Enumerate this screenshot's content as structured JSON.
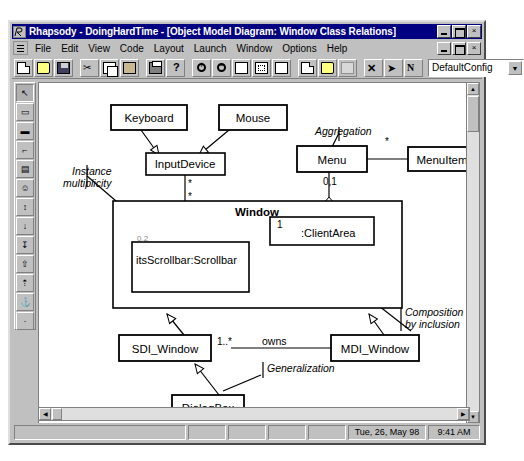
{
  "window": {
    "title": "Rhapsody - DoingHardTime - [Object Model Diagram: Window Class Relations]",
    "app_icon": "rhapsody-icon",
    "minimize_label": "",
    "maximize_label": "",
    "close_label": "×"
  },
  "menubar": {
    "items": [
      {
        "label": "File"
      },
      {
        "label": "Edit"
      },
      {
        "label": "View"
      },
      {
        "label": "Code"
      },
      {
        "label": "Layout"
      },
      {
        "label": "Launch"
      },
      {
        "label": "Window"
      },
      {
        "label": "Options"
      },
      {
        "label": "Help"
      }
    ],
    "mdi_restore_label": "",
    "mdi_minimize_label": "",
    "mdi_close_label": "×"
  },
  "toolbar": {
    "buttons": [
      {
        "name": "new-file-icon",
        "glyph": "g-doc"
      },
      {
        "name": "open-file-icon",
        "glyph": "g-open"
      },
      {
        "name": "save-file-icon",
        "glyph": "g-save"
      },
      {
        "name": "cut-icon",
        "glyph": "g-cut",
        "char": "✂"
      },
      {
        "name": "copy-icon",
        "glyph": "g-copy"
      },
      {
        "name": "paste-icon",
        "glyph": "g-paste"
      },
      {
        "name": "print-icon",
        "glyph": "g-print"
      },
      {
        "name": "help-icon",
        "glyph": "g-help"
      },
      {
        "name": "zoom-in-icon",
        "glyph": "g-zin"
      },
      {
        "name": "zoom-out-icon",
        "glyph": "g-zout"
      },
      {
        "name": "zoom-fit-icon",
        "glyph": "g-rect"
      },
      {
        "name": "zoom-selection-icon",
        "glyph": "g-fit"
      },
      {
        "name": "refresh-icon",
        "glyph": "g-rect"
      },
      {
        "name": "new-diagram-icon",
        "glyph": "g-doc"
      },
      {
        "name": "browse-icon",
        "glyph": "g-open"
      },
      {
        "name": "properties-icon",
        "glyph": "g-blank"
      },
      {
        "name": "delete-icon",
        "glyph": "g-x",
        "char": "✕"
      },
      {
        "name": "run-icon",
        "glyph": "g-arrow",
        "char": "➤"
      },
      {
        "name": "next-icon",
        "glyph": "g-n",
        "char": "N"
      }
    ],
    "config_combo": {
      "value": "DefaultConfig",
      "arrow": "▼"
    }
  },
  "palette": {
    "buttons": [
      {
        "name": "select-tool",
        "char": "↖",
        "selected": true
      },
      {
        "name": "class-tool",
        "char": "▭"
      },
      {
        "name": "object-tool",
        "char": "▬"
      },
      {
        "name": "package-tool",
        "char": "⌐"
      },
      {
        "name": "note-tool",
        "char": "▤"
      },
      {
        "name": "actor-tool",
        "char": "☺"
      },
      {
        "name": "association-tool",
        "char": "↕"
      },
      {
        "name": "aggregation-tool",
        "char": "↓"
      },
      {
        "name": "composition-tool",
        "char": "↧"
      },
      {
        "name": "generalization-tool",
        "char": "⇧"
      },
      {
        "name": "dependency-tool",
        "char": "⇡"
      },
      {
        "name": "anchor-tool",
        "char": "⚓"
      },
      {
        "name": "text-tool",
        "char": "·"
      }
    ]
  },
  "diagram": {
    "title": "Object Model Diagram: Window Class Relations",
    "classes": [
      {
        "id": "keyboard",
        "label": "Keyboard",
        "x": 100,
        "y": 82,
        "w": 76,
        "h": 22
      },
      {
        "id": "mouse",
        "label": "Mouse",
        "x": 208,
        "y": 82,
        "w": 68,
        "h": 22
      },
      {
        "id": "inputdevice",
        "label": "InputDevice",
        "x": 135,
        "y": 129,
        "w": 78,
        "h": 20
      },
      {
        "id": "menu",
        "label": "Menu",
        "x": 286,
        "y": 122,
        "w": 70,
        "h": 24
      },
      {
        "id": "menuitem",
        "label": "MenuItem",
        "x": 397,
        "y": 124,
        "w": 68,
        "h": 22
      },
      {
        "id": "window",
        "label": "Window",
        "x": 102,
        "y": 178,
        "w": 289,
        "h": 107
      },
      {
        "id": "scrollbar",
        "label": "itsScrollbar:Scrollbar",
        "x": 121,
        "y": 219,
        "w": 117,
        "h": 50
      },
      {
        "id": "clientarea",
        "label": ":ClientArea",
        "x": 259,
        "y": 194,
        "w": 104,
        "h": 28
      },
      {
        "id": "sdi",
        "label": "SDI_Window",
        "x": 108,
        "y": 312,
        "w": 92,
        "h": 24
      },
      {
        "id": "mdi",
        "label": "MDI_Window",
        "x": 320,
        "y": 312,
        "w": 88,
        "h": 24
      },
      {
        "id": "dialogbox",
        "label": "DialogBox",
        "x": 161,
        "y": 372,
        "w": 72,
        "h": 22
      }
    ],
    "multiplicities": [
      {
        "id": "mult-menuitem",
        "label": "*",
        "x": 374,
        "y": 112
      },
      {
        "id": "mult-menu-01",
        "label": "0,1",
        "x": 312,
        "y": 150
      },
      {
        "id": "mult-input-top",
        "label": "*",
        "x": 177,
        "y": 152
      },
      {
        "id": "mult-input-bot",
        "label": "*",
        "x": 177,
        "y": 166
      },
      {
        "id": "mult-scrollbar",
        "label": "0,2",
        "x": 126,
        "y": 215
      },
      {
        "id": "mult-clientarea",
        "label": "1",
        "x": 268,
        "y": 192
      },
      {
        "id": "mult-owns",
        "label": "1..*",
        "x": 207,
        "y": 304
      }
    ],
    "annotations": [
      {
        "id": "anno-aggregation",
        "label": "Aggregation",
        "x": 304,
        "y": 100,
        "italic": true
      },
      {
        "id": "anno-instance",
        "label": "Instance",
        "x": 60,
        "y": 147,
        "italic": true
      },
      {
        "id": "anno-multiplicity",
        "label": "multiplicity",
        "x": 52,
        "y": 159,
        "italic": true
      },
      {
        "id": "anno-composition1",
        "label": "Composition shown",
        "x": 372,
        "y": 283,
        "italic": true
      },
      {
        "id": "anno-composition2",
        "label": "by inclusion",
        "x": 372,
        "y": 295,
        "italic": true
      },
      {
        "id": "anno-generalization",
        "label": "Generalization",
        "x": 235,
        "y": 345,
        "italic": true
      }
    ],
    "association_labels": [
      {
        "id": "label-owns",
        "label": "owns",
        "x": 249,
        "y": 312
      }
    ]
  },
  "statusbar": {
    "panes": [
      "",
      "",
      "",
      "",
      ""
    ],
    "date": "Tue, 26, May 98",
    "time": "9:41 AM"
  },
  "colors": {
    "titlebar": "#000080",
    "face": "#c0c0c0",
    "canvas": "#ffffff",
    "line": "#000000"
  }
}
